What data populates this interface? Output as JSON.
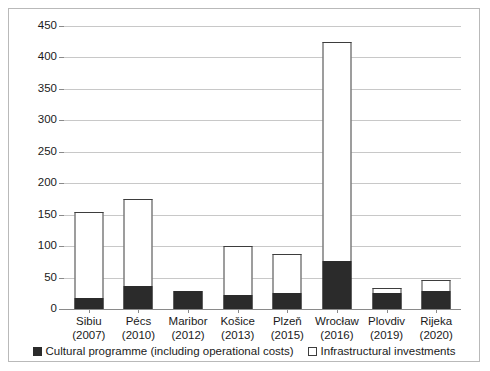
{
  "chart_data": {
    "type": "bar",
    "stacked": true,
    "title": "",
    "subtitle": "",
    "xlabel": "",
    "ylabel": "",
    "ylim": [
      0,
      450
    ],
    "yticks": [
      0,
      50,
      100,
      150,
      200,
      250,
      300,
      350,
      400,
      450
    ],
    "ytick_labels": [
      "0",
      "50",
      "100",
      "150",
      "200",
      "250",
      "300",
      "350",
      "400",
      "450"
    ],
    "grid": true,
    "legend_position": "bottom",
    "categories": [
      "Sibiu (2007)",
      "Pécs (2010)",
      "Maribor (2012)",
      "Košice (2013)",
      "Plzeň (2015)",
      "Wrocław (2016)",
      "Plovdiv (2019)",
      "Rijeka (2020)"
    ],
    "category_cities": [
      "Sibiu",
      "Pécs",
      "Maribor",
      "Košice",
      "Plzeň",
      "Wrocław",
      "Plovdiv",
      "Rijeka"
    ],
    "category_years": [
      "(2007)",
      "(2010)",
      "(2012)",
      "(2013)",
      "(2015)",
      "(2016)",
      "(2019)",
      "(2020)"
    ],
    "series": [
      {
        "name": "Cultural programme (including operational costs)",
        "color": "#2b2b2b",
        "values": [
          18,
          36,
          28,
          23,
          25,
          77,
          25,
          29
        ]
      },
      {
        "name": "Infrastructural investments",
        "color": "#ffffff",
        "values": [
          137,
          139,
          0,
          77,
          62,
          348,
          9,
          17
        ]
      }
    ],
    "totals": [
      155,
      175,
      28,
      100,
      87,
      425,
      34,
      46
    ]
  },
  "legend": {
    "entries": [
      {
        "label": "Cultural programme (including operational costs)",
        "marker": "filled-square"
      },
      {
        "label": "Infrastructural investments",
        "marker": "hollow-square"
      }
    ]
  },
  "colors": {
    "cultural": "#2b2b2b",
    "infrastructural": "#ffffff",
    "grid": "#c8c8c8",
    "axis": "#8a8a8a",
    "frame": "#b9b9b9",
    "text": "#1a1a1a"
  }
}
